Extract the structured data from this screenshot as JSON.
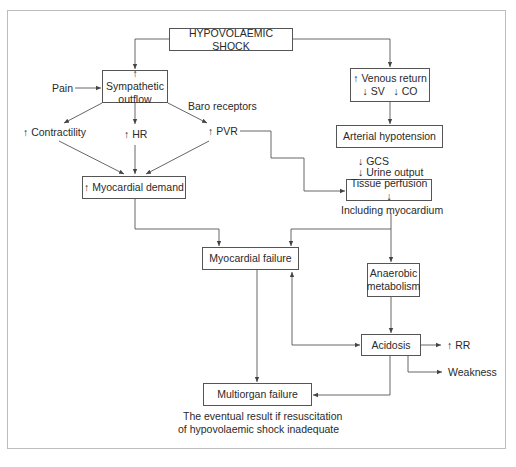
{
  "diagram": {
    "nodes": {
      "shock": "HYPOVOLAEMIC SHOCK",
      "sympathetic_line1": "↑ Sympathetic",
      "sympathetic_line2": "outflow",
      "venous_line1": "↑ Venous return",
      "venous_line2": "↓ SV   ↓ CO",
      "arterial_hypotension": "Arterial hypotension",
      "myocardial_demand": "↑ Myocardial demand",
      "tissue_perfusion": "Tissue perfusion ↓",
      "myocardial_failure": "Myocardial failure",
      "anaerobic_line1": "Anaerobic",
      "anaerobic_line2": "metabolism",
      "acidosis": "Acidosis",
      "multiorgan_failure": "Multiorgan failure"
    },
    "labels": {
      "pain": "Pain",
      "baro_receptors": "Baro receptors",
      "contractility": "↑ Contractility",
      "hr": "↑ HR",
      "pvr": "↑ PVR",
      "gcs": "↓ GCS",
      "urine_output": "↓ Urine output",
      "including_myocardium": "Including myocardium",
      "rr": "↑ RR",
      "weakness": "Weakness",
      "footnote_line1": "The eventual result if resuscitation",
      "footnote_line2": "of hypovolaemic shock inadequate"
    },
    "colors": {
      "line": "#555555",
      "frame": "#bdbdbd",
      "text": "#2a2a2a"
    }
  }
}
